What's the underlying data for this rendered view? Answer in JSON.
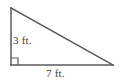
{
  "figure": {
    "name": "right-triangle-figure",
    "background_color": "#ffffff",
    "stroke_color": "#5a5a5a",
    "text_color": "#3d3d3d",
    "stroke_width": 1.5,
    "vertices": {
      "top": [
        11,
        8
      ],
      "bottom_left": [
        11,
        65
      ],
      "bottom_right": [
        113,
        65
      ]
    },
    "right_angle_marker": {
      "name": "right-angle-marker",
      "corner": [
        11,
        65
      ],
      "size": 7
    },
    "labels": {
      "vertical_leg": "3 ft.",
      "horizontal_leg": "7 ft."
    }
  }
}
